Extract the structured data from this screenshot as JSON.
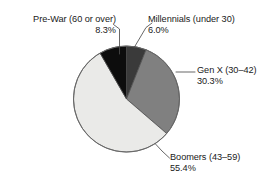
{
  "chart_data": {
    "type": "pie",
    "title": "",
    "subtitle": "",
    "xlabel": "",
    "ylabel": "",
    "legend_position": "none",
    "grid": false,
    "labels_mode": "callout-with-leader-lines",
    "start_angle_deg": 0,
    "direction": "clockwise",
    "categories": [
      "Millennials (under 30)",
      "Gen X (30–42)",
      "Boomers (43–59)",
      "Pre-War (60 or over)"
    ],
    "values": [
      6.0,
      30.3,
      55.4,
      8.3
    ],
    "unit": "%",
    "slices": [
      {
        "name": "Millennials (under 30)",
        "value": 6.0,
        "value_label": "6.0%",
        "color": "#3a3a3a",
        "start_deg": 0.0,
        "end_deg": 21.6
      },
      {
        "name": "Gen X (30–42)",
        "value": 30.3,
        "value_label": "30.3%",
        "color": "#808080",
        "start_deg": 21.6,
        "end_deg": 130.7
      },
      {
        "name": "Boomers (43–59)",
        "value": 55.4,
        "value_label": "55.4%",
        "color": "#eaeae8",
        "start_deg": 130.7,
        "end_deg": 330.1
      },
      {
        "name": "Pre-War (60 or over)",
        "value": 8.3,
        "value_label": "8.3%",
        "color": "#0d0d0d",
        "start_deg": 330.1,
        "end_deg": 360.0
      }
    ]
  },
  "annotations": {
    "prewar": {
      "label": "Pre-War (60 or over)",
      "percent": "8.3%"
    },
    "millennials": {
      "label": "Millennials (under 30)",
      "percent": "6.0%"
    },
    "genx": {
      "label": "Gen X (30–42)",
      "percent": "30.3%"
    },
    "boomers": {
      "label": "Boomers (43–59)",
      "percent": "55.4%"
    }
  },
  "colors": {
    "background": "#ffffff",
    "text": "#1a1a1a",
    "outline": "#4d4d4d",
    "leader_line": "#4d4d4d"
  }
}
